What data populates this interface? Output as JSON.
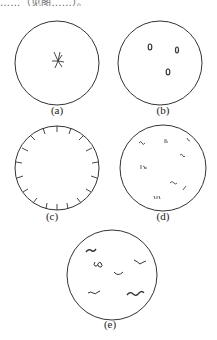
{
  "top_text": "……（见图……）。",
  "panels": [
    {
      "id": "a",
      "label": "(a)",
      "cx": 57,
      "cy": 63,
      "r": 42,
      "label_x": 57,
      "label_y": 110,
      "description": "single star-shaped cluster at center"
    },
    {
      "id": "b",
      "label": "(b)",
      "cx": 160,
      "cy": 63,
      "r": 42,
      "label_x": 163,
      "label_y": 110,
      "description": "three small ovals"
    },
    {
      "id": "c",
      "label": "(c)",
      "cx": 57,
      "cy": 168,
      "r": 42,
      "label_x": 52,
      "label_y": 215,
      "description": "short radial ticks along inner edge of circle"
    },
    {
      "id": "d",
      "label": "(d)",
      "cx": 163,
      "cy": 168,
      "r": 43,
      "label_x": 163,
      "label_y": 215,
      "description": "scattered small scribbles"
    },
    {
      "id": "e",
      "label": "(e)",
      "cx": 112,
      "cy": 275,
      "r": 45,
      "label_x": 110,
      "label_y": 323,
      "description": "scattered wavy filament shapes"
    }
  ],
  "colors": {
    "stroke": "#333333",
    "background": "#ffffff"
  }
}
